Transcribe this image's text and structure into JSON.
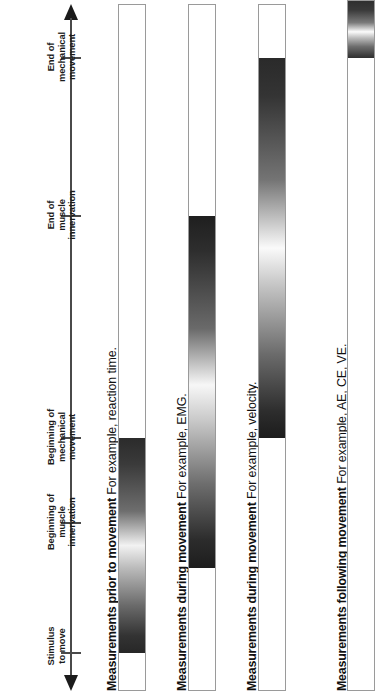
{
  "figure": {
    "orientation": "rotated-90-ccw",
    "axis": {
      "name": "time-axis",
      "arrow_top": "arrow-up",
      "arrow_bottom": "arrow-down",
      "line_color": "#4a4a4a"
    },
    "events": [
      {
        "id": "stimulus-to-move",
        "label": "Stimulus\nto move",
        "y": 652
      },
      {
        "id": "beginning-of-muscle-innervation",
        "label": "Beginning of\nmuscle\ninnervation",
        "y": 522
      },
      {
        "id": "beginning-of-mechanical-movement",
        "label": "Beginning of\nmechanical\nmovement",
        "y": 437
      },
      {
        "id": "end-of-muscle-innervation",
        "label": "End of\nmuscle\ninnervation",
        "y": 215
      },
      {
        "id": "end-of-mechanical-movement",
        "label": "End of\nmechanical\nmovement",
        "y": 57
      }
    ],
    "rows": [
      {
        "id": "measurements-prior-to-movement",
        "caption_bold": "Measurements prior to movement",
        "caption_rest": " For example, reaction time.",
        "bar": {
          "top": 4,
          "height": 687,
          "fill_top": 437,
          "fill_height": 215
        }
      },
      {
        "id": "measurements-during-movement-emg",
        "caption_bold": "Measurements during movement",
        "caption_rest": " For example, EMG.",
        "bar": {
          "top": 4,
          "height": 687,
          "fill_top": 215,
          "fill_height": 352
        }
      },
      {
        "id": "measurements-during-movement-velocity",
        "caption_bold": "Measurements during movement",
        "caption_rest": " For example, velocity.",
        "bar": {
          "top": 4,
          "height": 687,
          "fill_top": 57,
          "fill_height": 380
        }
      },
      {
        "id": "measurements-following-movement",
        "caption_bold": "Measurements following movement",
        "caption_rest": " For example, AE, CE, VE.",
        "bar": {
          "top": 0,
          "height": 691,
          "fill_top": 0,
          "fill_height": 57
        }
      }
    ],
    "colors": {
      "gradient_dark": "#262626",
      "gradient_light": "#ffffff",
      "bar_border": "#9a9a9a",
      "text": "#111111",
      "axis": "#4a4a4a"
    }
  }
}
